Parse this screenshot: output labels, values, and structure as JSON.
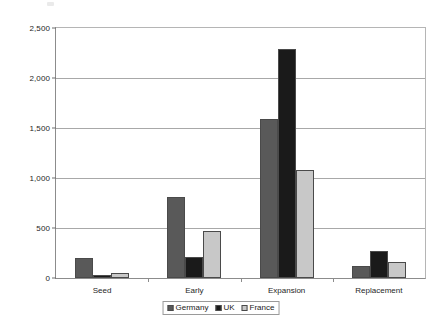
{
  "chart_data": {
    "type": "bar",
    "title": "",
    "subtitle": "",
    "xlabel": "",
    "ylabel": "",
    "categories": [
      "Seed",
      "Early",
      "Expansion",
      "Replacement"
    ],
    "series": [
      {
        "name": "Germany",
        "color": "#595959",
        "values": [
          200,
          810,
          1590,
          125
        ]
      },
      {
        "name": "UK",
        "color": "#1a1a1a",
        "values": [
          35,
          215,
          2290,
          275
        ]
      },
      {
        "name": "France",
        "color": "#c8c8c8",
        "values": [
          55,
          475,
          1080,
          165
        ]
      }
    ],
    "ylim": [
      0,
      2500
    ],
    "y_ticks": [
      0,
      500,
      1000,
      1500,
      2000,
      2500
    ],
    "y_tick_labels": [
      "0",
      "500",
      "1,000",
      "1,500",
      "2,000",
      "2,500"
    ],
    "grid": true,
    "legend_position": "bottom",
    "orientation": "vertical",
    "grouping": "grouped"
  }
}
